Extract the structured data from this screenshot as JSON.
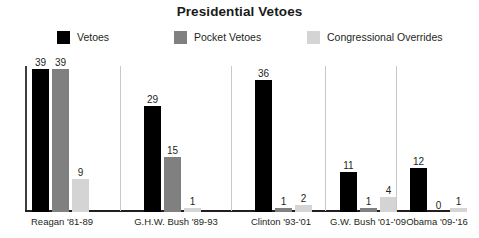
{
  "chart_data": {
    "type": "bar",
    "title": "Presidential Vetoes",
    "subtitle": "",
    "xlabel": "",
    "ylabel": "",
    "grid": false,
    "legend_position": "top",
    "ylim": [
      0,
      39
    ],
    "categories": [
      "Reagan '81-89",
      "G.H.W. Bush '89-93",
      "Clinton '93-'01",
      "G.W. Bush '01-'09",
      "Obama '09-'16"
    ],
    "series": [
      {
        "name": "Vetoes",
        "color": "#000000",
        "values": [
          39,
          29,
          36,
          11,
          12
        ],
        "labels": [
          "39",
          "29",
          "36",
          "11",
          "12"
        ]
      },
      {
        "name": "Pocket Vetoes",
        "color": "#808080",
        "values": [
          39,
          15,
          1,
          1,
          0
        ],
        "labels": [
          "39",
          "15",
          "1",
          "1",
          "0"
        ]
      },
      {
        "name": "Congressional Overrides",
        "color": "#d4d4d4",
        "values": [
          9,
          1,
          2,
          4,
          1
        ],
        "labels": [
          "9",
          "1",
          "2",
          "4",
          "1"
        ]
      }
    ]
  },
  "chart": {
    "title": "Presidential Vetoes"
  },
  "legend": {
    "items": [
      {
        "label": "Vetoes",
        "color": "#000000",
        "swatch_name": "legend-swatch-vetoes"
      },
      {
        "label": "Pocket Vetoes",
        "color": "#808080",
        "swatch_name": "legend-swatch-pocket-vetoes"
      },
      {
        "label": "Congressional Overrides",
        "color": "#d4d4d4",
        "swatch_name": "legend-swatch-congressional-overrides"
      }
    ]
  },
  "axis": {
    "x_labels": [
      "Reagan '81-89",
      "G.H.W. Bush '89-93",
      "Clinton '93-'01",
      "G.W. Bush '01-'09",
      "Obama '09-'16"
    ]
  },
  "colors": {
    "vetoes": "#000000",
    "pocket_vetoes": "#808080",
    "congressional_overrides": "#d4d4d4",
    "axis": "#231f20",
    "separator": "#c9c9c9",
    "text": "#231f20",
    "background": "#ffffff"
  }
}
